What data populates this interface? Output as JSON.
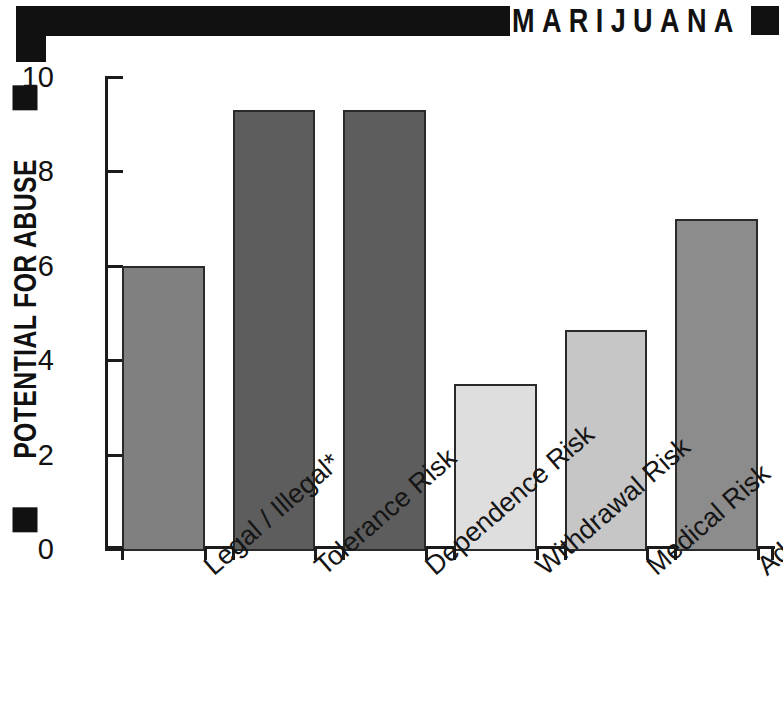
{
  "header": {
    "title": "MARIJUANA",
    "bar_color": "#111111"
  },
  "axis": {
    "y_title": "POTENTIAL FOR ABUSE"
  },
  "chart_data": {
    "type": "bar",
    "title": "MARIJUANA",
    "xlabel": "",
    "ylabel": "POTENTIAL FOR ABUSE",
    "ylim": [
      0,
      10
    ],
    "yticks": [
      "0",
      "2",
      "4",
      "6",
      "8",
      "10"
    ],
    "grid": false,
    "legend": "none",
    "categories": [
      "Legal / Illegal*",
      "Tolerance Risk",
      "Dependence Risk",
      "Withdrawal Risk",
      "Medical Risk",
      "Addiction Risk"
    ],
    "values": [
      6.0,
      9.3,
      9.3,
      3.5,
      4.65,
      7.0
    ],
    "bar_colors": [
      "#808080",
      "#5d5d5d",
      "#5d5d5d",
      "#dedede",
      "#c6c6c6",
      "#8c8c8c"
    ],
    "bar_edge_color": "#2a2a2a",
    "footnote": "*"
  }
}
